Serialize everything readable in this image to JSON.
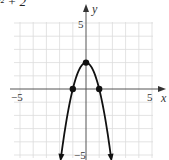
{
  "title": "2x² + 2",
  "chart_data": {
    "type": "line",
    "xlabel": "x",
    "ylabel": "y",
    "xlim": [
      -5,
      5
    ],
    "ylim": [
      -5,
      5
    ],
    "grid": true,
    "tick_labels": {
      "x": [
        "-5",
        "5"
      ],
      "y": [
        "5",
        "-5"
      ]
    },
    "series": [
      {
        "name": "y = -2x^2 + 2",
        "function": "-2x^2 + 2",
        "x": [
          -1.9,
          -1.5,
          -1,
          -0.5,
          0,
          0.5,
          1,
          1.5,
          1.9
        ],
        "y": [
          -5.22,
          -2.5,
          0,
          1.5,
          2,
          1.5,
          0,
          -2.5,
          -5.22
        ],
        "arrows_at_ends": true
      }
    ],
    "marked_points": [
      {
        "x": -1,
        "y": 0
      },
      {
        "x": 0,
        "y": 2
      },
      {
        "x": 1,
        "y": 0
      }
    ]
  },
  "labels": {
    "x_axis": "x",
    "y_axis": "y",
    "x_min": "−5",
    "x_max": "5",
    "y_max": "5",
    "y_min": "−5"
  },
  "colors": {
    "grid": "#dcdcdc",
    "axis": "#555555",
    "curve": "#111111"
  }
}
